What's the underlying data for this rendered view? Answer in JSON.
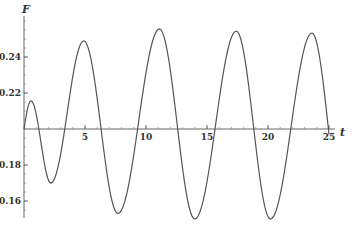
{
  "chart_data": {
    "type": "line",
    "title": "",
    "xlabel": "t",
    "ylabel": "F",
    "xlim": [
      0,
      25.8
    ],
    "ylim": [
      0.147,
      0.265
    ],
    "x_axis_crosses_y_at": 0.2,
    "grid": false,
    "legend": null,
    "x_ticks": [
      5,
      10,
      15,
      20,
      25
    ],
    "x_tick_labels": [
      "5",
      "10",
      "15",
      "20",
      "25"
    ],
    "x_minor_tick_step": 1,
    "y_ticks": [
      0.16,
      0.18,
      0.22,
      0.24
    ],
    "y_tick_labels": [
      "0.16",
      "0.18",
      "0.22",
      "0.24"
    ],
    "y_minor_tick_step": 0.005,
    "line_color": "#555555",
    "series": [
      {
        "name": "F(t)",
        "extrema": [
          {
            "t": 0.0,
            "F": 0.2
          },
          {
            "t": 0.57,
            "F": 0.2156
          },
          {
            "t": 2.2,
            "F": 0.17
          },
          {
            "t": 4.9,
            "F": 0.249
          },
          {
            "t": 7.7,
            "F": 0.153
          },
          {
            "t": 11.1,
            "F": 0.2556
          },
          {
            "t": 14.0,
            "F": 0.15
          },
          {
            "t": 17.4,
            "F": 0.2544
          },
          {
            "t": 20.2,
            "F": 0.15
          },
          {
            "t": 23.6,
            "F": 0.2533
          },
          {
            "t": 25.0,
            "F": 0.197
          }
        ]
      }
    ]
  }
}
